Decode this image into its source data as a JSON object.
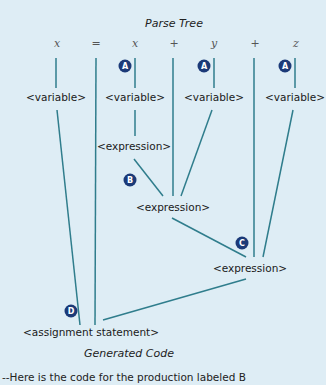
{
  "titles": {
    "parse_tree": "Parse Tree",
    "generated_code": "Generated Code"
  },
  "tokens": [
    "x",
    "=",
    "x",
    "+",
    "y",
    "+",
    "z"
  ],
  "nodes": {
    "var1": "<variable>",
    "var2": "<variable>",
    "var3": "<variable>",
    "var4": "<variable>",
    "expr1": "<expression>",
    "expr2": "<expression>",
    "expr3": "<expression>",
    "assign": "<assignment statement>"
  },
  "badges": {
    "a1": "A",
    "a2": "A",
    "a3": "A",
    "b": "B",
    "c": "C",
    "d": "D"
  },
  "code_line": "--Here is the code for the production labeled B",
  "colors": {
    "background": "#deedf5",
    "edge": "#2f7d8c",
    "badge": "#1b3a78"
  }
}
